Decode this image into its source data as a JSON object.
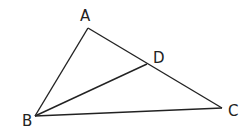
{
  "diagram": {
    "type": "triangle",
    "points": {
      "A": {
        "label": "A",
        "x": 88,
        "y": 28
      },
      "B": {
        "label": "B",
        "x": 35,
        "y": 116
      },
      "C": {
        "label": "C",
        "x": 222,
        "y": 108
      },
      "D": {
        "label": "D",
        "x": 147,
        "y": 64
      }
    },
    "segments": [
      "AB",
      "AC",
      "BC",
      "BD"
    ],
    "stroke_color": "#222222"
  }
}
